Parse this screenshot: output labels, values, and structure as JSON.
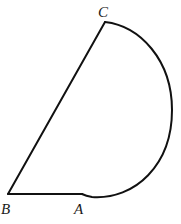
{
  "figure": {
    "type": "geometry",
    "stroke_color": "#111111",
    "points": {
      "A": {
        "label": "A"
      },
      "B": {
        "label": "B"
      },
      "C": {
        "label": "C"
      }
    }
  }
}
